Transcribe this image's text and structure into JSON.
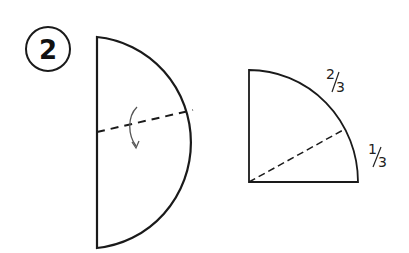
{
  "step": {
    "number": "2"
  },
  "semicircle": {
    "fold_line": "dashed",
    "fold_arrow": "curved-arrow-down"
  },
  "quarter_circle": {
    "labels": {
      "upper_arc": {
        "numerator": "2",
        "denominator": "3"
      },
      "lower_arc": {
        "numerator": "1",
        "denominator": "3"
      }
    },
    "division_line": "dashed"
  },
  "colors": {
    "stroke": "#1a1a1a",
    "background": "#ffffff"
  }
}
